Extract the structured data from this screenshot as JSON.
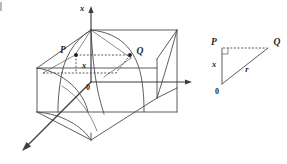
{
  "figure": {
    "background_color": "#ffffff",
    "line_color": "#4a4a50",
    "label_color": "#1f1f24",
    "width": 287,
    "height": 164
  },
  "main_diagram": {
    "name": "3d-box-diagram",
    "axes": [
      {
        "id": "vertical-axis",
        "label": "x",
        "direction": "up",
        "arrow": true
      },
      {
        "id": "horizontal-axis",
        "label": "",
        "direction": "right",
        "arrow": true
      },
      {
        "id": "depth-axis",
        "label": "",
        "direction": "down-left",
        "arrow": true
      }
    ],
    "origin_label": "0",
    "points": [
      {
        "id": "point-p",
        "label": "P"
      },
      {
        "id": "point-q",
        "label": "Q"
      }
    ],
    "measure_label": "x",
    "segments": [
      {
        "id": "pq-dashed",
        "style": "dashed",
        "from": "P",
        "to": "Q"
      },
      {
        "id": "p-drop-dashed",
        "style": "dashed",
        "from": "P",
        "to": "base"
      },
      {
        "id": "apex-to-p",
        "style": "solid-thin"
      },
      {
        "id": "apex-to-q",
        "style": "solid-thin"
      }
    ]
  },
  "inset_triangle": {
    "name": "right-triangle-inset",
    "vertices": [
      {
        "id": "triangle-vertex-p",
        "label": "P",
        "position": "top-left"
      },
      {
        "id": "triangle-vertex-q",
        "label": "Q",
        "position": "top-right"
      },
      {
        "id": "triangle-vertex-o",
        "label": "0",
        "position": "bottom-left"
      }
    ],
    "side_labels": [
      {
        "id": "side-x",
        "label": "x",
        "side": "vertical-leg"
      },
      {
        "id": "side-r",
        "label": "r",
        "side": "hypotenuse"
      }
    ],
    "right_angle_marker": true,
    "top_edge_style": "dashed"
  }
}
